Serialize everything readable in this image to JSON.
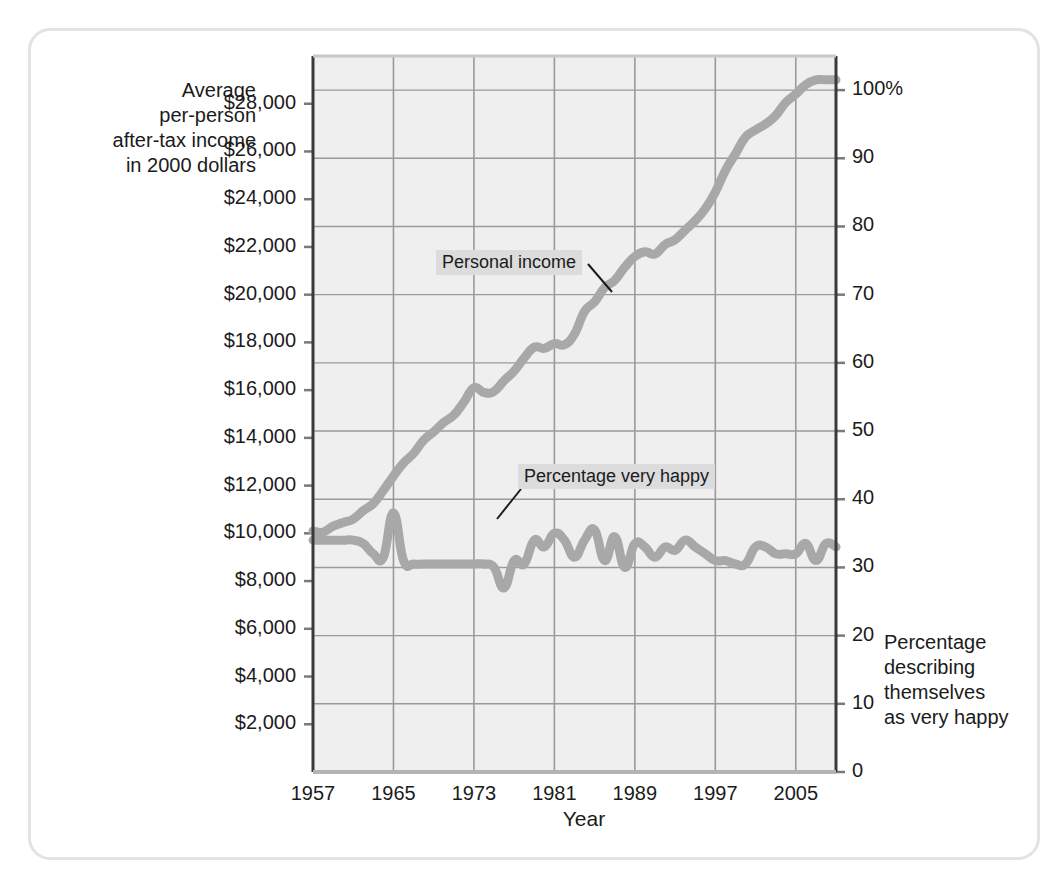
{
  "figure": {
    "frame_color": "#e3e3e3",
    "plot_bg": "#efefef",
    "grid_color": "#9a9a9a",
    "axis_color": "#3a3a3a",
    "series_color": "#a8a8a8",
    "label_bg": "#dcdcdc"
  },
  "axes": {
    "left_title": "Average\nper-person\nafter-tax income\nin 2000 dollars",
    "right_title": "Percentage\ndescribing\nthemselves\nas very happy",
    "x_title": "Year",
    "left_ticks": [
      "$28,000",
      "$26,000",
      "$24,000",
      "$22,000",
      "$20,000",
      "$18,000",
      "$16,000",
      "$14,000",
      "$12,000",
      "$10,000",
      "$8,000",
      "$6,000",
      "$4,000",
      "$2,000"
    ],
    "right_ticks": [
      "100%",
      "90",
      "80",
      "70",
      "60",
      "50",
      "40",
      "30",
      "20",
      "10",
      "0"
    ],
    "x_ticks": [
      "1957",
      "1965",
      "1973",
      "1981",
      "1989",
      "1997",
      "2005"
    ]
  },
  "annotations": {
    "income_label": "Personal income",
    "happy_label": "Percentage very happy"
  },
  "chart_data": {
    "type": "line",
    "title": "",
    "xlabel": "Year",
    "ylabel": "Average per-person after-tax income in 2000 dollars",
    "y2label": "Percentage describing themselves as very happy",
    "xlim": [
      1957,
      2009
    ],
    "ylim": [
      0,
      30000
    ],
    "y2lim": [
      0,
      105
    ],
    "grid": true,
    "legend": "inline-annotations",
    "x_tick_values": [
      1957,
      1965,
      1973,
      1981,
      1989,
      1997,
      2005
    ],
    "y_tick_values": [
      2000,
      4000,
      6000,
      8000,
      10000,
      12000,
      14000,
      16000,
      18000,
      20000,
      22000,
      24000,
      26000,
      28000
    ],
    "y2_tick_values": [
      0,
      10,
      20,
      30,
      40,
      50,
      60,
      70,
      80,
      90,
      100
    ],
    "series": [
      {
        "name": "Personal income",
        "axis": "left",
        "units": "2000 dollars",
        "x": [
          1957,
          1958,
          1959,
          1960,
          1961,
          1962,
          1963,
          1964,
          1965,
          1966,
          1967,
          1968,
          1969,
          1970,
          1971,
          1972,
          1973,
          1974,
          1975,
          1976,
          1977,
          1978,
          1979,
          1980,
          1981,
          1982,
          1983,
          1984,
          1985,
          1986,
          1987,
          1988,
          1989,
          1990,
          1991,
          1992,
          1993,
          1994,
          1995,
          1996,
          1997,
          1998,
          1999,
          2000,
          2001,
          2002,
          2003,
          2004,
          2005,
          2006,
          2007,
          2008,
          2009
        ],
        "values": [
          10100,
          10050,
          10300,
          10450,
          10600,
          10950,
          11250,
          11800,
          12400,
          12950,
          13350,
          13900,
          14250,
          14650,
          14950,
          15500,
          16100,
          15900,
          15950,
          16400,
          16800,
          17350,
          17800,
          17750,
          17950,
          17900,
          18350,
          19300,
          19700,
          20300,
          20600,
          21150,
          21600,
          21800,
          21700,
          22100,
          22300,
          22700,
          23100,
          23600,
          24300,
          25200,
          25900,
          26600,
          26900,
          27150,
          27500,
          28050,
          28400,
          28800,
          29000,
          29000,
          29000
        ]
      },
      {
        "name": "Percentage very happy",
        "axis": "right",
        "units": "percent",
        "x": [
          1957,
          1958,
          1959,
          1960,
          1961,
          1962,
          1963,
          1964,
          1965,
          1966,
          1967,
          1968,
          1969,
          1970,
          1971,
          1972,
          1973,
          1974,
          1975,
          1976,
          1977,
          1978,
          1979,
          1980,
          1981,
          1982,
          1983,
          1984,
          1985,
          1986,
          1987,
          1988,
          1989,
          1990,
          1991,
          1992,
          1993,
          1994,
          1995,
          1996,
          1997,
          1998,
          1999,
          2000,
          2001,
          2002,
          2003,
          2004,
          2005,
          2006,
          2007,
          2008,
          2009
        ],
        "values": [
          34,
          34,
          34,
          34,
          34,
          33.5,
          32,
          31.5,
          38,
          31,
          30.5,
          30.5,
          30.5,
          30.5,
          30.5,
          30.5,
          30.5,
          30.5,
          30,
          27,
          31,
          30.5,
          34,
          33,
          35,
          34,
          31.5,
          34,
          35.5,
          31,
          34.5,
          30,
          33.5,
          33,
          31.5,
          33,
          32.5,
          34,
          33,
          32,
          31,
          31,
          30.5,
          30.5,
          33,
          33,
          32,
          32,
          32,
          33.5,
          31,
          33.5,
          33
        ]
      }
    ]
  }
}
